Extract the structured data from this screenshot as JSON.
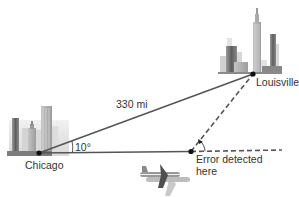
{
  "diagram": {
    "labels": {
      "distance": "330 mi",
      "angle_chicago": "10°",
      "chicago": "Chicago",
      "louisville": "Louisville",
      "error_line1": "Error detected",
      "error_line2": "here"
    },
    "points": {
      "chicago": [
        39,
        153
      ],
      "louisville": [
        253,
        74
      ],
      "error": [
        191,
        151
      ]
    },
    "colors": {
      "line": "#555555",
      "point": "#111111",
      "building_dark": "#6b6b6b",
      "building_light": "#cfcfcf"
    }
  }
}
